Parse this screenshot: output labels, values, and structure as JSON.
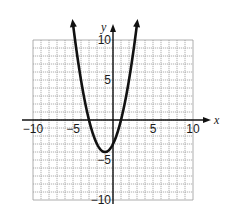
{
  "chart_data": {
    "type": "line",
    "title": "",
    "xlabel": "x",
    "ylabel": "y",
    "xlim": [
      -10,
      10
    ],
    "ylim": [
      -10,
      10
    ],
    "grid": true,
    "grid_step": 1,
    "x_ticks": [
      -10,
      -5,
      5,
      10
    ],
    "y_ticks": [
      10,
      5,
      -5,
      -10
    ],
    "x_tick_labels": [
      "−10",
      "−5",
      "5",
      "10"
    ],
    "y_tick_labels": [
      "10",
      "5",
      "−5",
      "−10"
    ],
    "series": [
      {
        "name": "parabola",
        "equation": "y = x^2 + 2x - 3",
        "vertex": [
          -1,
          -4
        ],
        "x_intercepts": [
          -3,
          1
        ],
        "y_intercept": -3,
        "arrow_ends": true,
        "x_range": [
          -5,
          3
        ],
        "color": "#111111"
      }
    ],
    "legend": null
  },
  "colors": {
    "grid": "#9a9a9a",
    "axis": "#111111",
    "curve": "#111111"
  }
}
